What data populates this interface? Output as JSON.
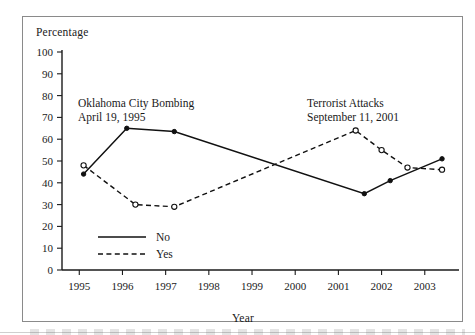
{
  "figure": {
    "ylabel": "Percentage",
    "xlabel": "Year"
  },
  "annotations": {
    "okc": {
      "line1": "Oklahoma City Bombing",
      "line2": "April 19, 1995"
    },
    "nine_eleven": {
      "line1": "Terrorist Attacks",
      "line2": "September 11, 2001"
    }
  },
  "legend": {
    "no_label": "No",
    "yes_label": "Yes"
  },
  "chart_data": {
    "type": "line",
    "title": "",
    "subtitle": "",
    "xlabel": "Year",
    "ylabel": "Percentage",
    "xlim": [
      1994.6,
      2003.7
    ],
    "ylim": [
      0,
      100
    ],
    "yticks": [
      0,
      10,
      20,
      30,
      40,
      50,
      60,
      70,
      80,
      90,
      100
    ],
    "xticks": [
      1995,
      1996,
      1997,
      1998,
      1999,
      2000,
      2001,
      2002,
      2003
    ],
    "xtick_labels": [
      "1995",
      "1996",
      "1997",
      "1998",
      "1999",
      "2000",
      "2001",
      "2002",
      "2003"
    ],
    "grid": false,
    "legend_position": "inner-lower-left",
    "annotations": [
      {
        "text": "Oklahoma City Bombing\nApril 19, 1995",
        "x": 1995.9,
        "y": 78
      },
      {
        "text": "Terrorist Attacks\nSeptember 11, 2001",
        "x": 2001.4,
        "y": 78
      }
    ],
    "series": [
      {
        "name": "No",
        "style": "solid",
        "marker": "filled-circle",
        "x": [
          1995.1,
          1996.1,
          1997.2,
          2001.6,
          2002.2,
          2003.4
        ],
        "values": [
          44,
          65,
          63.5,
          35,
          41,
          51
        ]
      },
      {
        "name": "Yes",
        "style": "dashed",
        "marker": "open-circle",
        "x": [
          1995.1,
          1996.3,
          1997.2,
          2001.4,
          2002.0,
          2002.6,
          2003.4
        ],
        "values": [
          48,
          30,
          29,
          64,
          55,
          47,
          46
        ]
      }
    ]
  }
}
